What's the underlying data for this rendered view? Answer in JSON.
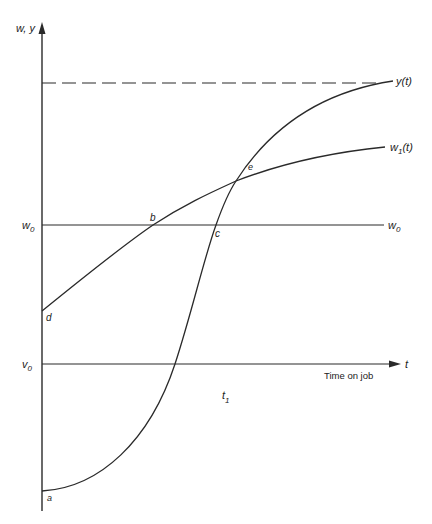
{
  "diagram": {
    "type": "economics-curve-diagram",
    "colors": {
      "line": "#2a2a2a",
      "background": "#ffffff",
      "text": "#222222"
    },
    "axes": {
      "y_label": "w, y",
      "x_label_symbol": "t",
      "x_caption": "Time on job"
    },
    "levels": {
      "w0_label": "w",
      "w0_sub": "0",
      "w0_right_label": "w",
      "w0_right_sub": "0",
      "v0_label": "v",
      "v0_sub": "0"
    },
    "curves": {
      "y_label": "y(t)",
      "w1_label": "w",
      "w1_sub": "1",
      "w1_suffix": "(t)"
    },
    "points": {
      "a": "a",
      "b": "b",
      "c": "c",
      "d": "d",
      "e": "e"
    },
    "t1": {
      "label": "t",
      "sub": "1"
    }
  }
}
